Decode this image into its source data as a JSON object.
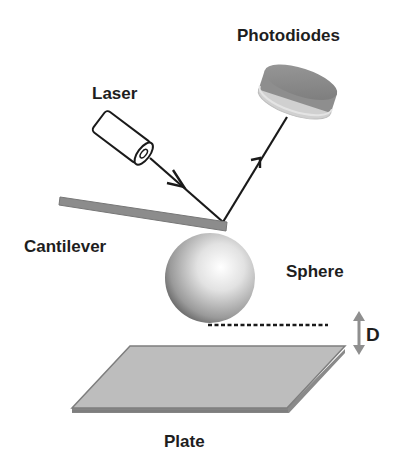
{
  "diagram": {
    "labels": {
      "photodiodes": "Photodiodes",
      "laser": "Laser",
      "cantilever": "Cantilever",
      "sphere": "Sphere",
      "distance": "D",
      "plate": "Plate"
    },
    "colors": {
      "background": "#ffffff",
      "text": "#1e1e1e",
      "beam": "#1a1a1a",
      "cantilever": "#8c8c8c",
      "plate_top": "#bdbdbd",
      "plate_edge": "#7e7e7e",
      "photodiode_body": "#8a8a8a",
      "photodiode_rim": "#c9c9c9",
      "d_arrow": "#8f8f8f"
    }
  }
}
